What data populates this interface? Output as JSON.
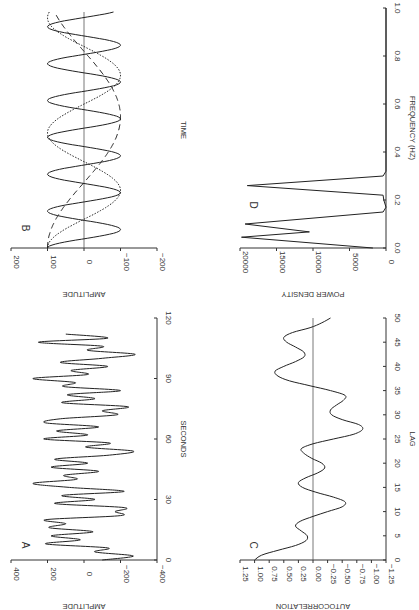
{
  "figure": {
    "orientation": "rotated 90 degrees clockwise",
    "panels": [
      "A",
      "B",
      "C",
      "D"
    ]
  },
  "chart_data": [
    {
      "panel": "A",
      "type": "line",
      "title": "",
      "xlabel": "SECONDS",
      "ylabel": "AMPLITUDE",
      "xlim": [
        0,
        120
      ],
      "ylim": [
        -400,
        400
      ],
      "xticks": [
        "0",
        "30",
        "60",
        "90",
        "120"
      ],
      "yticks": [
        "400",
        "200",
        "0",
        "−200",
        "−400"
      ],
      "x": [
        0,
        2,
        4,
        6,
        8,
        10,
        12,
        14,
        16,
        18,
        20,
        22,
        24,
        26,
        28,
        30,
        32,
        34,
        36,
        38,
        40,
        42,
        44,
        46,
        48,
        50,
        52,
        54,
        56,
        58,
        60,
        62,
        64,
        66,
        68,
        70,
        72,
        74,
        76,
        78,
        80,
        82,
        84,
        86,
        88,
        90,
        92,
        94,
        96,
        98,
        100,
        102,
        104,
        106,
        108,
        110,
        112
      ],
      "values": [
        -100,
        -270,
        -60,
        -130,
        210,
        20,
        180,
        -50,
        190,
        100,
        210,
        -200,
        -170,
        -220,
        160,
        -60,
        120,
        -220,
        80,
        280,
        40,
        110,
        -80,
        180,
        -20,
        160,
        -140,
        -270,
        -10,
        -140,
        220,
        -20,
        150,
        -80,
        210,
        130,
        -180,
        -100,
        -240,
        120,
        -60,
        90,
        -200,
        110,
        50,
        280,
        -20,
        70,
        -130,
        130,
        -100,
        -280,
        -20,
        -100,
        250,
        -130,
        100
      ],
      "grid": false
    },
    {
      "panel": "B",
      "type": "line",
      "title": "",
      "xlabel": "TIME",
      "ylabel": "AMPLITUDE",
      "ylim": [
        -200,
        200
      ],
      "yticks": [
        "200",
        "100",
        "0",
        "−100",
        "−200"
      ],
      "series": [
        {
          "name": "fast component (solid)",
          "style": "solid",
          "amplitude": 100,
          "relative_frequency": 0.26,
          "cycles_shown": 6.4
        },
        {
          "name": "medium component (dotted)",
          "style": "dotted",
          "amplitude": 100,
          "relative_frequency": 0.1,
          "cycles_shown": 2.05
        },
        {
          "name": "slow component (dashed)",
          "style": "dashed",
          "amplitude": 100,
          "relative_frequency": 0.045,
          "cycles_shown": 0.9
        }
      ],
      "grid": false
    },
    {
      "panel": "C",
      "type": "line",
      "title": "",
      "xlabel": "LAG",
      "ylabel": "AUTOCORRELATION",
      "xlim": [
        0,
        50
      ],
      "ylim": [
        -1.25,
        1.25
      ],
      "xticks": [
        "0",
        "5",
        "10",
        "15",
        "20",
        "25",
        "30",
        "35",
        "40",
        "45",
        "50"
      ],
      "yticks": [
        "1.25",
        "1.00",
        "0.75",
        "0.50",
        "0.25",
        "0.00",
        "−0.25",
        "−0.50",
        "−0.75",
        "−1.00",
        "−1.25"
      ],
      "x": [
        0,
        1,
        2,
        3,
        4,
        5,
        6,
        7,
        8,
        9,
        10,
        11,
        12,
        13,
        14,
        15,
        16,
        17,
        18,
        19,
        20,
        21,
        22,
        23,
        24,
        25,
        26,
        27,
        28,
        29,
        30,
        31,
        32,
        33,
        34,
        35,
        36,
        37,
        38,
        39,
        40,
        41,
        42,
        43,
        44,
        45,
        46,
        47,
        48,
        49,
        50
      ],
      "values": [
        1.0,
        0.88,
        0.6,
        0.3,
        0.12,
        0.1,
        0.2,
        0.3,
        0.22,
        0.0,
        -0.25,
        -0.5,
        -0.55,
        -0.35,
        -0.05,
        0.18,
        0.25,
        0.12,
        -0.08,
        -0.2,
        -0.15,
        0.02,
        0.15,
        0.2,
        0.0,
        -0.35,
        -0.7,
        -0.85,
        -0.78,
        -0.5,
        -0.32,
        -0.3,
        -0.4,
        -0.52,
        -0.55,
        -0.3,
        0.05,
        0.4,
        0.6,
        0.65,
        0.5,
        0.3,
        0.15,
        0.16,
        0.3,
        0.45,
        0.5,
        0.35,
        0.05,
        -0.15,
        -0.3
      ],
      "grid": false
    },
    {
      "panel": "D",
      "type": "line",
      "title": "",
      "xlabel": "FREQUENCY (HZ)",
      "ylabel": "POWER DENSITY",
      "xlim": [
        0,
        1.0
      ],
      "ylim": [
        0,
        20000
      ],
      "xticks": [
        "0.0",
        "0.2",
        "0.4",
        "0.6",
        "0.8",
        "1.0"
      ],
      "yticks": [
        "20000",
        "15000",
        "10000",
        "5000",
        "0"
      ],
      "x": [
        0.0,
        0.045,
        0.067,
        0.1,
        0.15,
        0.17,
        0.2,
        0.22,
        0.26,
        0.3,
        0.32,
        1.0
      ],
      "values": [
        1800,
        19800,
        10500,
        19300,
        400,
        0,
        300,
        400,
        19000,
        400,
        0,
        0
      ],
      "grid": false
    }
  ],
  "labels": {
    "A": "A",
    "B": "B",
    "C": "C",
    "D": "D",
    "a_xlabel": "SECONDS",
    "a_ylabel": "AMPLITUDE",
    "b_xlabel": "TIME",
    "b_ylabel": "AMPLITUDE",
    "c_xlabel": "LAG",
    "c_ylabel": "AUTOCORRELATION",
    "d_xlabel": "FREQUENCY (HZ)",
    "d_ylabel": "POWER DENSITY"
  }
}
